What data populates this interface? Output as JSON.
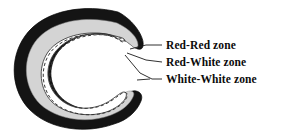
{
  "figure": {
    "name": "meniscus-vascular-zones-diagram"
  },
  "diagram": {
    "layers": [
      {
        "id": "outer-band",
        "name": "red-red-zone-band",
        "color": "#141414",
        "label_ref": "red-red"
      },
      {
        "id": "middle-band",
        "name": "red-white-zone-band",
        "color": "#d4d4d4",
        "label_ref": "red-white"
      },
      {
        "id": "inner-band",
        "name": "white-white-zone-band",
        "color": "#ffffff",
        "label_ref": "white-white"
      }
    ],
    "dashed_boundary": {
      "name": "red-white-boundary-dashed-line",
      "color": "#3a3a3a"
    },
    "inner_outline": {
      "name": "inner-contour-line",
      "color": "#2b2b2b"
    }
  },
  "labels": {
    "red_red": "Red-Red zone",
    "red_white": "Red-White zone",
    "white_white": "White-White zone"
  },
  "leader_lines": {
    "color": "#1a1a1a",
    "items": [
      {
        "name": "leader-line-red-red",
        "from": [
          131,
          50
        ],
        "to": [
          162,
          46
        ]
      },
      {
        "name": "leader-line-red-white",
        "from": [
          128,
          53
        ],
        "to": [
          162,
          63
        ]
      },
      {
        "name": "leader-line-white-white",
        "from": [
          137,
          79
        ],
        "to": [
          162,
          80
        ]
      }
    ]
  },
  "colors": {
    "background": "#ffffff",
    "outer_dark": "#141414",
    "middle_gray": "#d4d4d4",
    "inner_white": "#ffffff",
    "text": "#0b0b0b"
  }
}
